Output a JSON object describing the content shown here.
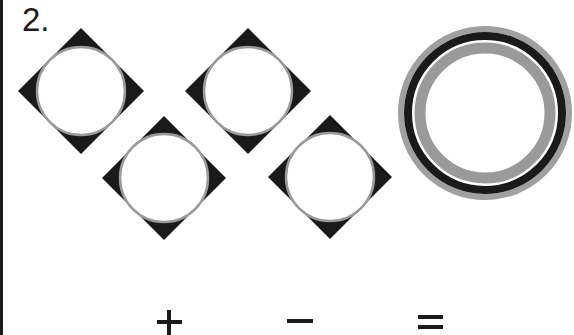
{
  "puzzle": {
    "number_label": "2.",
    "shapes": [
      {
        "type": "diamond-with-circle",
        "cx": 81,
        "cy": 91,
        "half_diagonal": 63,
        "circle_r": 45
      },
      {
        "type": "diamond-with-circle",
        "cx": 248,
        "cy": 91,
        "half_diagonal": 63,
        "circle_r": 45
      },
      {
        "type": "diamond-with-circle",
        "cx": 164,
        "cy": 178,
        "half_diagonal": 62,
        "circle_r": 45
      },
      {
        "type": "diamond-with-circle",
        "cx": 330,
        "cy": 177,
        "half_diagonal": 62,
        "circle_r": 45
      }
    ],
    "rings": {
      "cx": 485,
      "cy": 113,
      "outer_r": 87
    },
    "operators": [
      "+",
      "−",
      "="
    ]
  },
  "colors": {
    "ink": "#1a1a1a",
    "gray": "#9a9a9a",
    "background": "#ffffff"
  }
}
